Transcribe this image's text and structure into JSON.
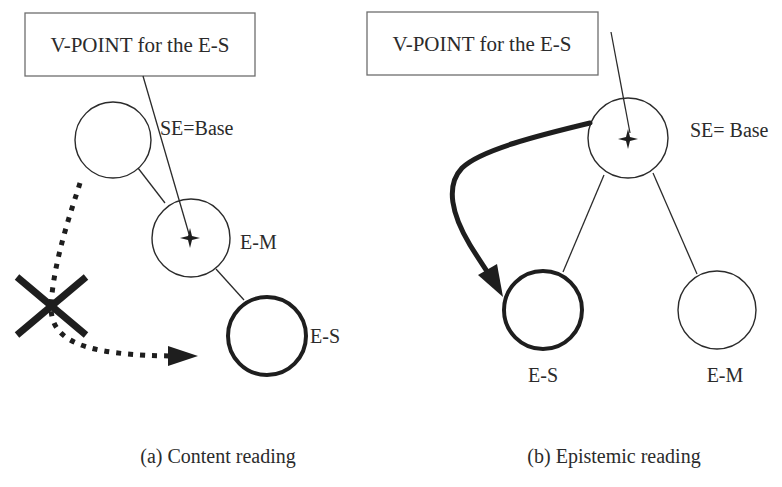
{
  "panels": [
    {
      "id": "a",
      "caption": "(a) Content reading",
      "vpoint_box": {
        "label": "V-POINT for the E-S"
      },
      "nodes": [
        {
          "id": "base",
          "label": "SE=Base"
        },
        {
          "id": "em",
          "label": "E-M",
          "vpoint": true
        },
        {
          "id": "es",
          "label": "E-S",
          "bold": true
        }
      ],
      "blocked_path": {
        "style": "dotted",
        "marker": "cross",
        "from": "base",
        "to": "es"
      }
    },
    {
      "id": "b",
      "caption": "(b) Epistemic reading",
      "vpoint_box": {
        "label": "V-POINT for the E-S"
      },
      "nodes": [
        {
          "id": "base",
          "label": "SE= Base",
          "vpoint": true
        },
        {
          "id": "es",
          "label": "E-S",
          "bold": true
        },
        {
          "id": "em",
          "label": "E-M"
        }
      ],
      "access_path": {
        "style": "solid-thick",
        "from": "base",
        "to": "es"
      }
    }
  ],
  "colors": {
    "stroke": "#2b2b2b",
    "box_border": "#6e6e6e",
    "background": "#ffffff"
  }
}
